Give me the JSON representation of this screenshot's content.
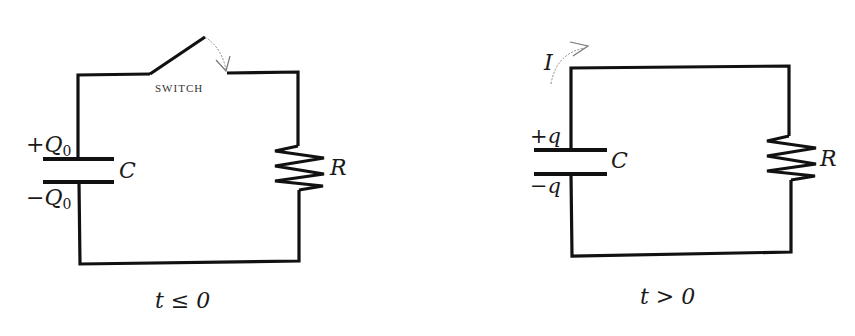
{
  "figure": {
    "left_circuit": {
      "name": "circuit before switch closes",
      "switch_label": "SWITCH",
      "top_plate_charge": "+Q",
      "top_plate_sub": "0",
      "bottom_plate_charge": "−Q",
      "bottom_plate_sub": "0",
      "capacitor_label": "C",
      "resistor_label": "R",
      "caption": "t ≤ 0"
    },
    "right_circuit": {
      "name": "circuit after switch closes",
      "current_label": "I",
      "top_plate_charge": "+q",
      "bottom_plate_charge": "−q",
      "capacitor_label": "C",
      "resistor_label": "R",
      "caption": "t > 0"
    },
    "colors": {
      "wire": "#111111",
      "arrow": "#888888",
      "background": "#ffffff"
    }
  }
}
